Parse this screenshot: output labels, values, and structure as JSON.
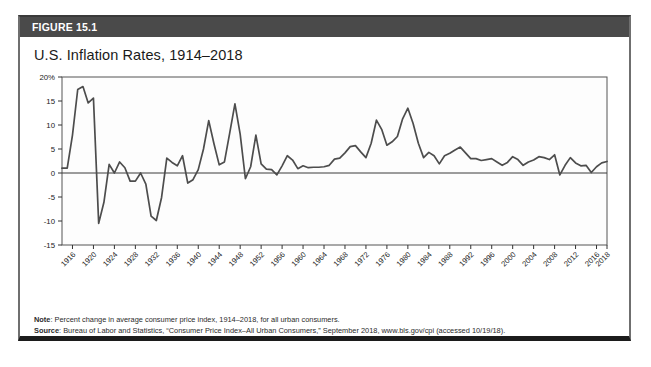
{
  "figure": {
    "label": "FIGURE 15.1",
    "title": "U.S. Inflation Rates, 1914–2018",
    "note_label": "Note",
    "note_text": ": Percent change in average consumer price index, 1914–2018, for all urban consumers.",
    "source_label": "Source",
    "source_text": ": Bureau of Labor and Statistics, “Consumer Price Index–All Urban Consumers,” September 2018, www.bls.gov/cpi (accessed 10/19/18)."
  },
  "colors": {
    "header_bar": "#4a4a4a",
    "line": "#4d4d4d",
    "plot_border": "#555555",
    "zero_line": "#3a3a3a",
    "card_border": "#6f6f6f",
    "card_bottom": "#1c1c1c"
  },
  "chart_data": {
    "type": "line",
    "title": "U.S. Inflation Rates, 1914–2018",
    "xlabel": "",
    "ylabel": "",
    "ylim": [
      -15,
      20
    ],
    "xlim": [
      1914,
      2018
    ],
    "grid": false,
    "legend": null,
    "ytick_labels": [
      "20%",
      "15",
      "10",
      "5",
      "0",
      "-5",
      "-10",
      "-15"
    ],
    "ytick_values": [
      20,
      15,
      10,
      5,
      0,
      -5,
      -10,
      -15
    ],
    "xtick_labels": [
      "1916",
      "1920",
      "1924",
      "1928",
      "1932",
      "1936",
      "1940",
      "1944",
      "1948",
      "1952",
      "1956",
      "1960",
      "1964",
      "1968",
      "1972",
      "1976",
      "1980",
      "1984",
      "1988",
      "1992",
      "1996",
      "2000",
      "2004",
      "2008",
      "2012",
      "2016",
      "2018"
    ],
    "xtick_values": [
      1916,
      1920,
      1924,
      1928,
      1932,
      1936,
      1940,
      1944,
      1948,
      1952,
      1956,
      1960,
      1964,
      1968,
      1972,
      1976,
      1980,
      1984,
      1988,
      1992,
      1996,
      2000,
      2004,
      2008,
      2012,
      2016,
      2018
    ],
    "series": [
      {
        "name": "U.S. Inflation Rate",
        "x": [
          1914,
          1915,
          1916,
          1917,
          1918,
          1919,
          1920,
          1921,
          1922,
          1923,
          1924,
          1925,
          1926,
          1927,
          1928,
          1929,
          1930,
          1931,
          1932,
          1933,
          1934,
          1935,
          1936,
          1937,
          1938,
          1939,
          1940,
          1941,
          1942,
          1943,
          1944,
          1945,
          1946,
          1947,
          1948,
          1949,
          1950,
          1951,
          1952,
          1953,
          1954,
          1955,
          1956,
          1957,
          1958,
          1959,
          1960,
          1961,
          1962,
          1963,
          1964,
          1965,
          1966,
          1967,
          1968,
          1969,
          1970,
          1971,
          1972,
          1973,
          1974,
          1975,
          1976,
          1977,
          1978,
          1979,
          1980,
          1981,
          1982,
          1983,
          1984,
          1985,
          1986,
          1987,
          1988,
          1989,
          1990,
          1991,
          1992,
          1993,
          1994,
          1995,
          1996,
          1997,
          1998,
          1999,
          2000,
          2001,
          2002,
          2003,
          2004,
          2005,
          2006,
          2007,
          2008,
          2009,
          2010,
          2011,
          2012,
          2013,
          2014,
          2015,
          2016,
          2017,
          2018
        ],
        "values": [
          1.0,
          1.0,
          7.9,
          17.4,
          18.0,
          14.6,
          15.6,
          -10.5,
          -6.1,
          1.8,
          0.0,
          2.3,
          1.1,
          -1.7,
          -1.7,
          0.0,
          -2.3,
          -9.0,
          -9.9,
          -5.1,
          3.1,
          2.2,
          1.5,
          3.6,
          -2.1,
          -1.4,
          0.7,
          5.0,
          10.9,
          6.1,
          1.7,
          2.3,
          8.3,
          14.4,
          8.1,
          -1.2,
          1.3,
          7.9,
          1.9,
          0.8,
          0.7,
          -0.4,
          1.5,
          3.6,
          2.7,
          0.9,
          1.5,
          1.1,
          1.2,
          1.2,
          1.3,
          1.6,
          2.9,
          3.1,
          4.2,
          5.5,
          5.7,
          4.4,
          3.2,
          6.2,
          11.0,
          9.1,
          5.8,
          6.5,
          7.6,
          11.3,
          13.5,
          10.3,
          6.2,
          3.2,
          4.3,
          3.6,
          1.9,
          3.6,
          4.1,
          4.8,
          5.4,
          4.2,
          3.0,
          3.0,
          2.6,
          2.8,
          3.0,
          2.3,
          1.6,
          2.2,
          3.4,
          2.8,
          1.6,
          2.3,
          2.7,
          3.4,
          3.2,
          2.8,
          3.8,
          -0.4,
          1.6,
          3.2,
          2.1,
          1.5,
          1.6,
          0.1,
          1.3,
          2.1,
          2.4
        ]
      }
    ]
  }
}
